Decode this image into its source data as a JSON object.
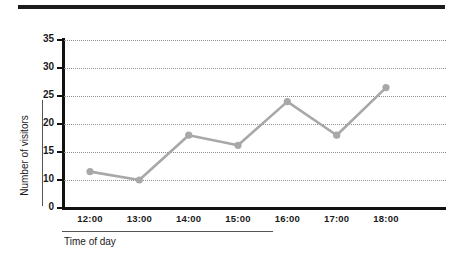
{
  "decor": {
    "top_bar_color": "#1c1c1c"
  },
  "chart_data": {
    "type": "line",
    "title": "",
    "xlabel": "Time of day",
    "ylabel": "Number of visitors",
    "categories": [
      "12:00",
      "13:00",
      "14:00",
      "15:00",
      "16:00",
      "17:00",
      "18:00"
    ],
    "values": [
      11.5,
      10,
      18,
      16.2,
      24,
      18,
      26.5
    ],
    "series": [
      {
        "name": "Number of visitors",
        "values": [
          11.5,
          10,
          18,
          16.2,
          24,
          18,
          26.5
        ]
      }
    ],
    "ytick_labels": [
      "35",
      "30",
      "25",
      "20",
      "15",
      "10",
      "0"
    ],
    "ytick_values": [
      35,
      30,
      25,
      20,
      15,
      10,
      0
    ],
    "ylim": [
      0,
      35
    ],
    "grid": true,
    "grid_style": "dotted",
    "legend": false,
    "legend_position": "none",
    "line_color": "#a8a8a8",
    "marker_color": "#a8a8a8",
    "marker_shape": "circle",
    "axis_color": "#111111",
    "gridline_color": "#8f8f8f",
    "axis_break_below": 10,
    "note": "y-axis is compressed between 0 and 10"
  }
}
